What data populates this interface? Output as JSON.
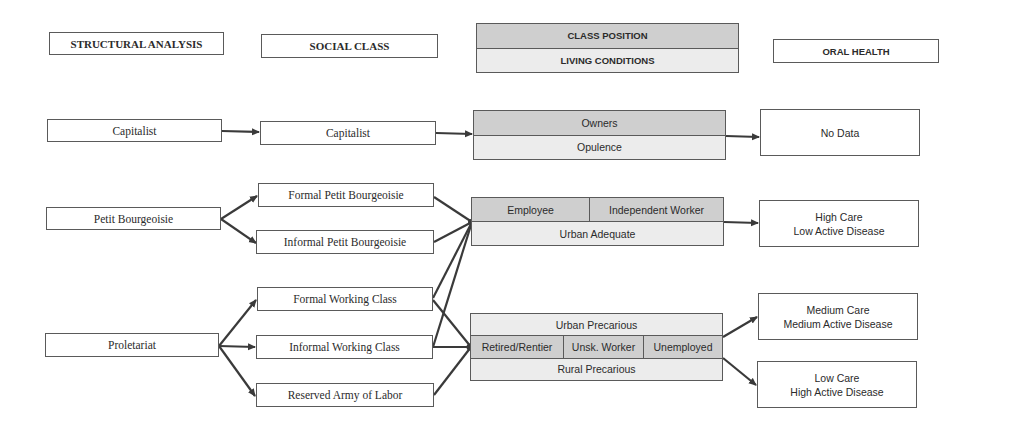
{
  "headers": {
    "structural_analysis": "STRUCTURAL ANALYSIS",
    "social_class": "SOCIAL CLASS",
    "class_position": "CLASS POSITION",
    "living_conditions": "LIVING CONDITIONS",
    "oral_health": "ORAL HEALTH"
  },
  "structural_analysis": {
    "capitalist": "Capitalist",
    "petit_bourgeoisie": "Petit Bourgeoisie",
    "proletariat": "Proletariat"
  },
  "social_class": {
    "capitalist": "Capitalist",
    "formal_petit_bourgeoisie": "Formal Petit Bourgeoisie",
    "informal_petit_bourgeoisie": "Informal Petit Bourgeoisie",
    "formal_working_class": "Formal Working Class",
    "informal_working_class": "Informal Working Class",
    "reserved_army": "Reserved Army of Labor"
  },
  "class_position": {
    "owners": {
      "position": "Owners",
      "living": "Opulence"
    },
    "urban_adequate": {
      "positions": [
        "Employee",
        "Independent Worker"
      ],
      "living": "Urban Adequate"
    },
    "precarious": {
      "living_top": "Urban Precarious",
      "positions": [
        "Retired/Rentier",
        "Unsk. Worker",
        "Unemployed"
      ],
      "living_bottom": "Rural Precarious"
    }
  },
  "oral_health": {
    "no_data": [
      "No Data"
    ],
    "high_care": [
      "High Care",
      "Low Active Disease"
    ],
    "medium_care": [
      "Medium Care",
      "Medium Active Disease"
    ],
    "low_care": [
      "Low Care",
      "High Active Disease"
    ]
  },
  "colors": {
    "border": "#5a5a5a",
    "position_fill": "#cfcfcf",
    "living_fill": "#ececec",
    "arrow": "#3a3a3a"
  }
}
